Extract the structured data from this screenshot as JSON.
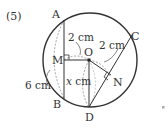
{
  "problem_number": "(5)",
  "points": {
    "A": "A",
    "B": "B",
    "C": "C",
    "D": "D",
    "M": "M",
    "N": "N",
    "O": "O"
  },
  "measures": {
    "MO": "2 cm",
    "ON": "2 cm",
    "AB": "6 cm",
    "OD_var": "x",
    "OD_unit": " cm"
  },
  "colors": {
    "line": "#333333",
    "dashed": "#8a8a8a",
    "background": "#ffffff"
  }
}
